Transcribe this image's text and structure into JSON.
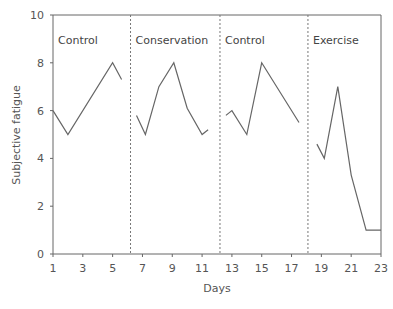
{
  "chart_data": {
    "type": "line",
    "title": "",
    "xlabel": "Days",
    "ylabel": "Subjective fatigue",
    "xlim": [
      1,
      23
    ],
    "ylim": [
      0,
      10
    ],
    "xticks": [
      1,
      3,
      5,
      7,
      9,
      11,
      13,
      15,
      17,
      19,
      21,
      23
    ],
    "yticks": [
      0,
      2,
      4,
      6,
      8,
      10
    ],
    "grid": false,
    "legend": null,
    "phase_dividers": [
      6.2,
      12.2,
      18.1
    ],
    "series": [
      {
        "name": "Control",
        "x": [
          1,
          2,
          5,
          5.6
        ],
        "y": [
          6.0,
          5.0,
          8.0,
          7.3
        ]
      },
      {
        "name": "Conservation",
        "x": [
          6.6,
          7.2,
          8.1,
          9.1,
          10,
          11,
          11.4
        ],
        "y": [
          5.8,
          5.0,
          7.0,
          8.0,
          6.1,
          5.0,
          5.2
        ]
      },
      {
        "name": "Control",
        "x": [
          12.6,
          13,
          14,
          15,
          17.5
        ],
        "y": [
          5.8,
          6.0,
          5.0,
          8.0,
          5.5
        ]
      },
      {
        "name": "Exercise",
        "x": [
          18.7,
          19.2,
          20.1,
          21,
          22,
          23
        ],
        "y": [
          4.6,
          4.0,
          7.0,
          3.3,
          1.0,
          1.0
        ]
      }
    ]
  },
  "labels": {
    "phases": [
      "Control",
      "Conservation",
      "Control",
      "Exercise"
    ],
    "xlabel": "Days",
    "ylabel": "Subjective fatigue",
    "yticks": [
      "0",
      "2",
      "4",
      "6",
      "8",
      "10"
    ],
    "xticks": [
      "1",
      "3",
      "5",
      "7",
      "9",
      "11",
      "13",
      "15",
      "17",
      "19",
      "21",
      "23"
    ]
  },
  "colors": {
    "line": "#666666",
    "axis": "#666666",
    "divider": "#777777"
  }
}
